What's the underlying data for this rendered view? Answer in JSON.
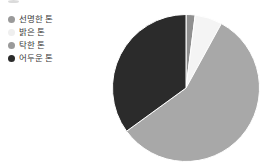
{
  "legend": {
    "items": [
      {
        "label": "선명한 톤",
        "color": "#9a9a9a",
        "marker": "circle-swatch"
      },
      {
        "label": "밝은 톤",
        "color": "#efefef",
        "marker": "circle-swatch"
      },
      {
        "label": "탁한 톤",
        "color": "#9a9a9a",
        "marker": "circle-swatch"
      },
      {
        "label": "어두운 톤",
        "color": "#2b2b2b",
        "marker": "circle-swatch"
      }
    ]
  },
  "chart_data": {
    "type": "pie",
    "title": "",
    "categories": [
      "선명한 톤",
      "밝은 톤",
      "탁한 톤",
      "어두운 톤"
    ],
    "values": [
      2,
      6,
      57,
      35
    ],
    "colors": [
      "#8f8f8f",
      "#f4f4f4",
      "#a8a8a8",
      "#2b2b2b"
    ],
    "legend_position": "left",
    "start_angle_deg": 0,
    "direction": "clockwise",
    "grid": false,
    "xlabel": "",
    "ylabel": ""
  }
}
